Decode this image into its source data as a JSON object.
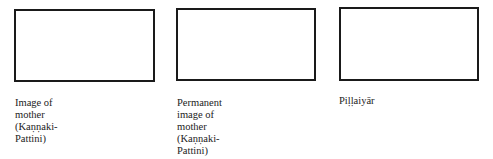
{
  "panels": [
    {
      "caption": "Image of\nmother\n(Kaṇṇaki-\nPattini)"
    },
    {
      "caption": "Permanent\nimage of\nmother\n(Kaṇṇaki-\nPattini)"
    },
    {
      "caption": "Piḷḷaiyār"
    }
  ]
}
